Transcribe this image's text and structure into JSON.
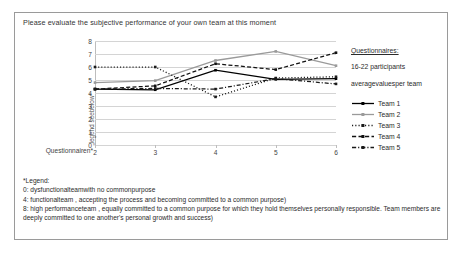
{
  "title": "Please evaluate the subjective performance of your own team at this moment",
  "panel": {
    "heading": "Questionnaires:",
    "participants": "16-22 participants",
    "averages": "averagevaluesper team"
  },
  "footnote": {
    "heading": "*Legend:",
    "line0": "0: dysfunctionalteamwith   no commonpurpose",
    "line4": "4: functionalteam , accepting the process and becoming committed to a common purpose)",
    "line8": "8: high performanceteam , equally committed to a common purpose for which they hold themselves personally responsible. Team members are deeply committed to one another's personal growth and success)"
  },
  "chart_data": {
    "type": "line",
    "title": "Please evaluate the subjective performance of your own team at this moment",
    "xlabel": "Questionnairen*",
    "ylabel": "„legend seebelow*",
    "x": [
      2,
      3,
      4,
      5,
      6
    ],
    "xticks": [
      "2",
      "3",
      "4",
      "5",
      "6"
    ],
    "yticks": [
      "0",
      "1",
      "2",
      "3",
      "4",
      "5",
      "6",
      "7",
      "8"
    ],
    "xlim": [
      2,
      6
    ],
    "ylim": [
      0,
      8
    ],
    "grid": true,
    "legend_position": "right",
    "series": [
      {
        "name": "Team 1",
        "values": [
          4.3,
          4.25,
          5.75,
          5.05,
          5.1
        ],
        "color": "#000000",
        "dash": "none",
        "marker": "square"
      },
      {
        "name": "Team 2",
        "values": [
          4.8,
          4.95,
          6.5,
          7.2,
          6.1
        ],
        "color": "#9a9a9a",
        "dash": "none",
        "marker": "square"
      },
      {
        "name": "Team 3",
        "values": [
          6.0,
          6.0,
          3.7,
          5.15,
          5.25
        ],
        "color": "#1a1a1a",
        "dash": "dotted",
        "marker": "square"
      },
      {
        "name": "Team 4",
        "values": [
          4.3,
          4.55,
          6.25,
          5.8,
          7.1
        ],
        "color": "#111111",
        "dash": "dashed",
        "marker": "square"
      },
      {
        "name": "Team 5",
        "values": [
          4.3,
          4.35,
          4.3,
          5.1,
          4.7
        ],
        "color": "#1a1a1a",
        "dash": "dashdot",
        "marker": "square"
      }
    ]
  }
}
